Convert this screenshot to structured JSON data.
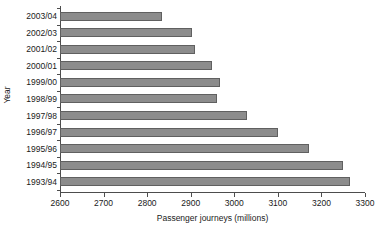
{
  "chart_data": {
    "type": "bar",
    "orientation": "horizontal",
    "title": "",
    "xlabel": "Passenger journeys (millions)",
    "ylabel": "Year",
    "categories": [
      "2003/04",
      "2002/03",
      "2001/02",
      "2000/01",
      "1999/00",
      "1998/99",
      "1997/98",
      "1996/97",
      "1995/96",
      "1994/95",
      "1993/94"
    ],
    "values": [
      2833,
      2904,
      2910,
      2949,
      2967,
      2960,
      3030,
      3101,
      3172,
      3249,
      3265
    ],
    "xlim": [
      2600,
      3300
    ],
    "xticks": [
      2600,
      2700,
      2800,
      2900,
      3000,
      3100,
      3200,
      3300
    ],
    "xtick_labels": [
      "2600",
      "2700",
      "2800",
      "2900",
      "3000",
      "3100",
      "3200",
      "3300"
    ],
    "grid": false,
    "legend": null,
    "bar_color": "#8c8c8c",
    "bar_border_color": "#606060",
    "axis_color": "#4d4d4d",
    "text_color": "#1a1a1a"
  }
}
